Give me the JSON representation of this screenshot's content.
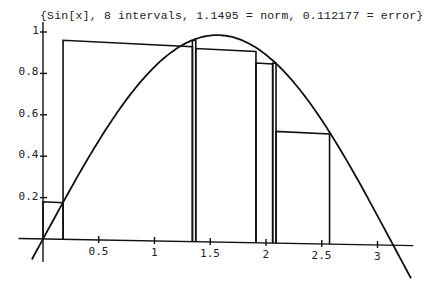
{
  "chart_data": {
    "type": "line",
    "title": "{Sin[x], 8 intervals, 1.1495 = norm, 0.112177 = error}",
    "function": "Sin[x]",
    "xlabel": "",
    "ylabel": "",
    "xlim": [
      -0.1,
      3.3
    ],
    "ylim": [
      -0.1,
      1.0
    ],
    "x_ticks": [
      "0.5",
      "1",
      "1.5",
      "2",
      "2.5",
      "3"
    ],
    "y_ticks": [
      "0.2",
      "0.4",
      "0.6",
      "0.8",
      "1"
    ],
    "grid": false,
    "legend": null,
    "annotations": {
      "intervals": 8,
      "norm": 1.1495,
      "error": 0.112177
    },
    "curve": {
      "name": "Sin[x]",
      "x": [
        -0.1,
        0.0,
        0.25,
        0.5,
        0.75,
        1.0,
        1.25,
        1.5,
        1.571,
        1.75,
        2.0,
        2.25,
        2.5,
        2.75,
        3.0,
        3.1416,
        3.3
      ],
      "y": [
        -0.1,
        0.0,
        0.247,
        0.479,
        0.682,
        0.841,
        0.949,
        0.997,
        1.0,
        0.984,
        0.909,
        0.778,
        0.598,
        0.382,
        0.141,
        0.0,
        -0.158
      ]
    },
    "rectangles": [
      {
        "x0": 0.0,
        "x1": 0.18,
        "height": 0.18
      },
      {
        "x0": 0.18,
        "x1": 1.34,
        "height": 0.96
      },
      {
        "x0": 1.34,
        "x1": 1.37,
        "height": 0.96
      },
      {
        "x0": 1.37,
        "x1": 1.91,
        "height": 0.92
      },
      {
        "x0": 1.91,
        "x1": 2.06,
        "height": 0.85
      },
      {
        "x0": 2.06,
        "x1": 2.09,
        "height": 0.85
      },
      {
        "x0": 2.09,
        "x1": 2.57,
        "height": 0.52
      },
      {
        "x0": 2.57,
        "x1": 2.57,
        "height": 0.0
      }
    ]
  }
}
